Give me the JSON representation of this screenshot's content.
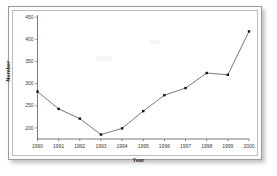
{
  "figure": {
    "frame_color": "#9a9a9a",
    "background": "#ffffff",
    "line_color": "#555555",
    "marker_color": "#111111",
    "axis_color": "#6b6b6b",
    "tick_label_color": "#3a3a3a"
  },
  "chart_data": {
    "type": "line",
    "title": "",
    "xlabel": "Year",
    "ylabel": "Number",
    "categories": [
      "1990",
      "1991",
      "1992",
      "1993",
      "1994",
      "1995",
      "1996",
      "1997",
      "1998",
      "1999",
      "2000"
    ],
    "x": [
      1990,
      1991,
      1992,
      1993,
      1994,
      1995,
      1996,
      1997,
      1998,
      1999,
      2000
    ],
    "values": [
      282,
      243,
      221,
      185,
      199,
      238,
      274,
      290,
      324,
      320,
      418
    ],
    "series": [
      {
        "name": "Number",
        "values": [
          282,
          243,
          221,
          185,
          199,
          238,
          274,
          290,
          324,
          320,
          418
        ]
      }
    ],
    "xlim": [
      1990,
      2000
    ],
    "ylim": [
      175,
      455
    ],
    "ytick_labels": [
      "200",
      "250",
      "300",
      "350",
      "400",
      "450"
    ],
    "yticks": [
      200,
      250,
      300,
      350,
      400,
      450
    ],
    "xtick_labels": [
      "1990",
      "1991",
      "1992",
      "1993",
      "1994",
      "1995",
      "1996",
      "1997",
      "1998",
      "1999",
      "2000"
    ],
    "grid": false,
    "legend": false,
    "marker": "square",
    "marker_size": 2.4,
    "line_width": 0.8
  }
}
